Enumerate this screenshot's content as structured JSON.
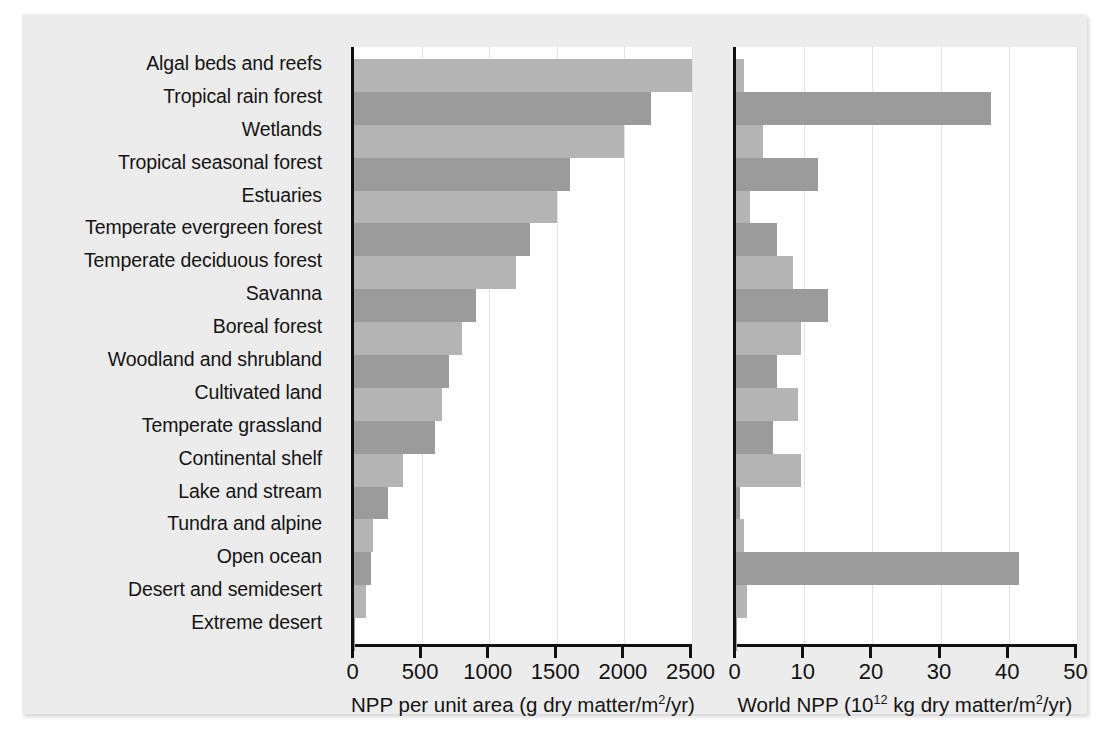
{
  "figure": {
    "background_color": "#ececec",
    "bar_color_light": "#b4b4b4",
    "bar_color_dark": "#9b9b9b",
    "axis_color": "#111111"
  },
  "chart_data": {
    "type": "bar",
    "orientation": "horizontal",
    "title": "",
    "grid": true,
    "legend": null,
    "categories": [
      "Algal beds and reefs",
      "Tropical rain forest",
      "Wetlands",
      "Tropical seasonal forest",
      "Estuaries",
      "Temperate evergreen forest",
      "Temperate deciduous forest",
      "Savanna",
      "Boreal forest",
      "Woodland and shrubland",
      "Cultivated land",
      "Temperate grassland",
      "Continental shelf",
      "Lake and stream",
      "Tundra and alpine",
      "Open ocean",
      "Desert and semidesert",
      "Extreme desert"
    ],
    "panels": [
      {
        "id": "left",
        "xlabel": "NPP per unit area (g dry matter/m²/yr)",
        "xlabel_parts": {
          "pre": "NPP per unit area (g dry matter/m",
          "sup": "2",
          "post": "/yr)"
        },
        "xlim": [
          0,
          2500
        ],
        "xticks": [
          0,
          500,
          1000,
          1500,
          2000,
          2500
        ],
        "xticklabels": [
          "0",
          "500",
          "1000",
          "1500",
          "2000",
          "2500"
        ],
        "values": [
          2500,
          2200,
          2000,
          1600,
          1500,
          1300,
          1200,
          900,
          800,
          700,
          650,
          600,
          360,
          250,
          140,
          125,
          90,
          3
        ]
      },
      {
        "id": "right",
        "xlabel": "World NPP (10¹² kg dry matter/m²/yr)",
        "xlabel_parts": {
          "pre": "World NPP (10",
          "sup": "12",
          "mid": " kg dry matter/m",
          "sup2": "2",
          "post": "/yr)"
        },
        "xlim": [
          0,
          50
        ],
        "xticks": [
          0,
          10,
          20,
          30,
          40,
          50
        ],
        "xticklabels": [
          "0",
          "10",
          "20",
          "30",
          "40",
          "50"
        ],
        "values": [
          1.1,
          37.4,
          4.0,
          12.0,
          2.1,
          6.0,
          8.4,
          13.5,
          9.6,
          6.0,
          9.1,
          5.4,
          9.6,
          0.6,
          1.1,
          41.5,
          1.6,
          0.07
        ]
      }
    ]
  }
}
